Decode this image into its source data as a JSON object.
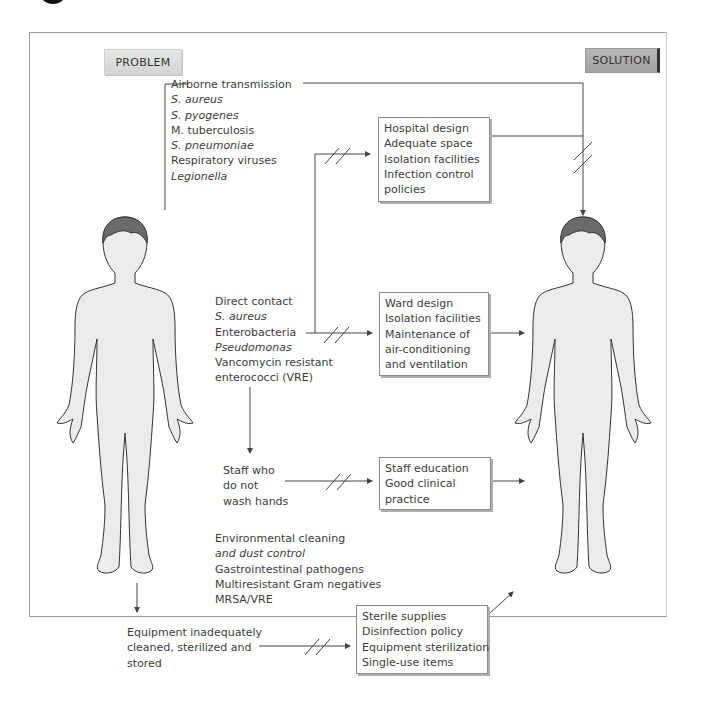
{
  "labels": {
    "problem": "PROBLEM",
    "solution": "SOLUTION"
  },
  "problems": {
    "airborne": {
      "title": "Airborne transmission",
      "items": [
        "S. aureus",
        "S. pyogenes",
        "M. tuberculosis",
        "S. pneumoniae",
        "Respiratory viruses",
        "Legionella"
      ]
    },
    "direct_contact": {
      "title": "Direct contact",
      "items": [
        "S. aureus",
        "Enterobacteria",
        "Pseudomonas",
        "Vancomycin resistant",
        "enterococci (VRE)"
      ]
    },
    "staff": {
      "lines": [
        "Staff who",
        "do not",
        "wash hands"
      ]
    },
    "environmental": {
      "lines": [
        "Environmental cleaning",
        "and dust control",
        "Gastrointestinal pathogens",
        "Multiresistant Gram negatives",
        "MRSA/VRE"
      ]
    },
    "equipment": {
      "lines": [
        "Equipment inadequately",
        "cleaned, sterilized and",
        "stored"
      ]
    }
  },
  "solutions": {
    "hospital": [
      "Hospital design",
      "Adequate space",
      "Isolation facilities",
      "Infection control",
      "policies"
    ],
    "ward": [
      "Ward design",
      "Isolation facilities",
      "Maintenance of",
      "air-conditioning",
      "and ventilation"
    ],
    "staff": [
      "Staff education",
      "Good clinical",
      "practice"
    ],
    "equipment": [
      "Sterile supplies",
      "Disinfection policy",
      "Equipment sterilization",
      "Single-use items"
    ]
  },
  "colors": {
    "line": "#444444",
    "body_fill": "#ececec",
    "hair": "#6a6a6a",
    "solution_tag": "#a8a8a8",
    "problem_tag": "#dcdcdc"
  }
}
